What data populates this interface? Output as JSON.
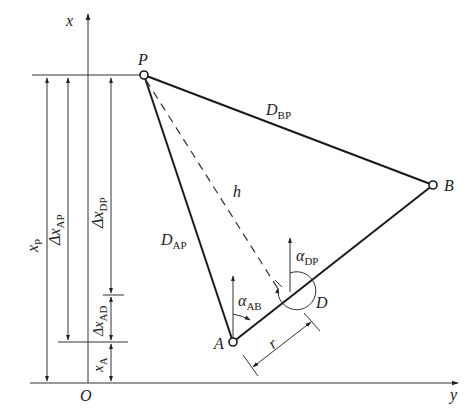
{
  "diagram": {
    "type": "surveying-geometry",
    "axes": {
      "vertical": "x",
      "horizontal": "y",
      "origin": "O"
    },
    "points": [
      {
        "id": "P",
        "label": "P",
        "x": 144,
        "y": 75
      },
      {
        "id": "B",
        "label": "B",
        "x": 433,
        "y": 185
      },
      {
        "id": "A",
        "label": "A",
        "x": 233,
        "y": 342
      },
      {
        "id": "D",
        "label": "D",
        "x": 290,
        "y": 306
      }
    ],
    "segments": [
      {
        "from": "P",
        "to": "B",
        "label_main": "D",
        "label_sub": "BP"
      },
      {
        "from": "P",
        "to": "A",
        "label_main": "D",
        "label_sub": "AP"
      },
      {
        "from": "A",
        "to": "B",
        "label_main": "",
        "label_sub": ""
      },
      {
        "from": "P",
        "to": "D",
        "style": "dashed",
        "label_main": "h",
        "label_sub": ""
      }
    ],
    "angles": [
      {
        "label_main": "α",
        "label_sub": "AB",
        "at": "A"
      },
      {
        "label_main": "α",
        "label_sub": "DP",
        "at": "D"
      }
    ],
    "dimensions": [
      {
        "label_main": "x",
        "label_sub": "P"
      },
      {
        "label_main": "Δx",
        "label_sub": "AP"
      },
      {
        "label_main": "Δx",
        "label_sub": "DP"
      },
      {
        "label_main": "Δx",
        "label_sub": "AD"
      },
      {
        "label_main": "x",
        "label_sub": "A"
      },
      {
        "label_main": "r",
        "label_sub": ""
      }
    ]
  },
  "labels": {
    "axis_x": "x",
    "axis_y": "y",
    "origin": "O",
    "P": "P",
    "B": "B",
    "A": "A",
    "D": "D",
    "h": "h",
    "r": "r",
    "D_main": "D",
    "BP": "BP",
    "AP": "AP",
    "alpha": "α",
    "AB": "AB",
    "DP": "DP",
    "x": "x",
    "delta_x": "Δx",
    "sub_P": "P",
    "sub_AP": "AP",
    "sub_DP": "DP",
    "sub_AD": "AD",
    "sub_A": "A"
  },
  "colors": {
    "line": "#222222",
    "background": "#ffffff"
  }
}
